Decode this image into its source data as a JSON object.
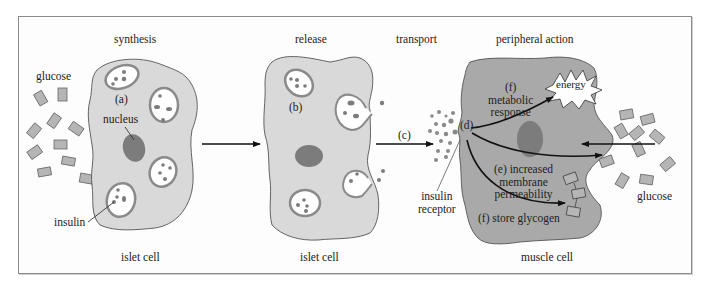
{
  "colors": {
    "islet_cell_fill": "#d9d9d9",
    "muscle_cell_fill": "#a9a9a9",
    "nucleus_fill": "#7c7c7c",
    "vesicle_ring": "#8a8a8a",
    "glucose_fill": "#b5b5b5",
    "arrow": "#111111",
    "frame_border": "#8a8a8a"
  },
  "stages": {
    "synthesis": "synthesis",
    "release": "release",
    "transport": "transport",
    "peripheral_action": "peripheral action"
  },
  "labels": {
    "glucose_left": "glucose",
    "glucose_right": "glucose",
    "a": "(a)",
    "nucleus": "nucleus",
    "insulin": "insulin",
    "islet_cell_1": "islet cell",
    "b": "(b)",
    "islet_cell_2": "islet cell",
    "c": "(c)",
    "d": "(d)",
    "insulin_receptor_line1": "insulin",
    "insulin_receptor_line2": "receptor",
    "f_metabolic_1": "(f)",
    "f_metabolic_2": "metabolic",
    "f_metabolic_3": "response",
    "energy": "energy",
    "e_1": "(e) increased",
    "e_2": "membrane",
    "e_3": "permeability",
    "f_store": "(f) store glycogen",
    "muscle_cell": "muscle cell"
  }
}
